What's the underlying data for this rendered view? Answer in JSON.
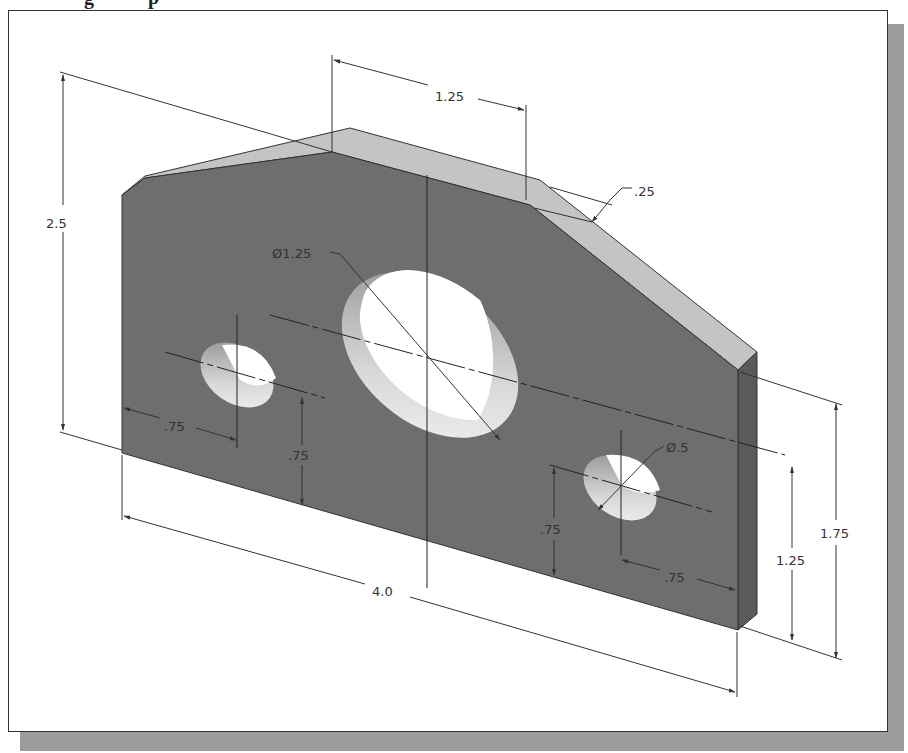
{
  "figure": {
    "type": "isometric-dimensioned-part-drawing",
    "colors": {
      "front_face": "#6e6e6e",
      "chamfer": "#c4c4c4",
      "side_face": "#5a5a5a",
      "hole_interior": "#ffffff",
      "hole_wall": "#b8b8b8",
      "frame_border": "#333333",
      "shadow": "#9c9c9c",
      "dimension_line": "#333333"
    },
    "dimensions": {
      "overall_width": "4.0",
      "overall_height": "2.5",
      "top_flat_length": "1.25",
      "chamfer_size": ".25",
      "large_hole_diameter": "Ø1.25",
      "small_hole_diameter": "Ø.5",
      "left_hole_horizontal_offset": ".75",
      "left_hole_vertical_offset": ".75",
      "right_hole_horizontal_offset": ".75",
      "right_hole_vertical_offset": ".75",
      "right_hole_center_height": "1.25",
      "right_edge_height": "1.75"
    }
  }
}
